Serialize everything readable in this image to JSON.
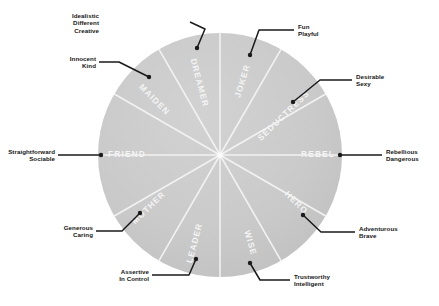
{
  "diagram": {
    "type": "pie-wheel",
    "segment_count": 12,
    "colors": {
      "segment_fill": "#c9c9c9",
      "segment_divider": "#f2f2f2",
      "segment_label": "#f4f4f4",
      "callout_line": "#1a1a1a",
      "callout_text": "#161616",
      "background": "#ffffff"
    },
    "geometry": {
      "center_x": 220,
      "center_y": 155,
      "radius": 122
    }
  },
  "segments": [
    {
      "name": "DREAMER",
      "traits": [
        "Idealistic",
        "Different",
        "Creative"
      ]
    },
    {
      "name": "JOKER",
      "traits": [
        "Fun",
        "Playful"
      ]
    },
    {
      "name": "SEDUCTRESS",
      "traits": [
        "Desirable",
        "Sexy"
      ]
    },
    {
      "name": "REBEL",
      "traits": [
        "Rebellious",
        "Dangerous"
      ]
    },
    {
      "name": "HERO",
      "traits": [
        "Adventurous",
        "Brave"
      ]
    },
    {
      "name": "WISE",
      "traits": [
        "Trustworthy",
        "Intelligent"
      ]
    },
    {
      "name": "LEADER",
      "traits": [
        "Assertive",
        "In Control"
      ]
    },
    {
      "name": "MOTHER",
      "traits": [
        "Generous",
        "Caring"
      ]
    },
    {
      "name": "FRIEND",
      "traits": [
        "Straightforward",
        "Sociable"
      ]
    },
    {
      "name": "MAIDEN",
      "traits": [
        "Innocent",
        "Kind"
      ]
    }
  ],
  "wheel_labels": {
    "dreamer": "DREAMER",
    "joker": "JOKER",
    "seductress": "SEDUCTRESS",
    "rebel": "REBEL",
    "hero": "HERO",
    "wise": "WISE",
    "leader": "LEADER",
    "mother": "MOTHER",
    "friend": "FRIEND",
    "maiden": "MAIDEN"
  },
  "callouts": {
    "dreamer": {
      "line1": "Idealistic",
      "line2": "Different",
      "line3": "Creative"
    },
    "maiden": {
      "line1": "Innocent",
      "line2": "Kind"
    },
    "friend": {
      "line1": "Straightforward",
      "line2": "Sociable"
    },
    "mother": {
      "line1": "Generous",
      "line2": "Caring"
    },
    "leader": {
      "line1": "Assertive",
      "line2": "In Control"
    },
    "wise": {
      "line1": "Trustworthy",
      "line2": "Intelligent"
    },
    "hero": {
      "line1": "Adventurous",
      "line2": "Brave"
    },
    "rebel": {
      "line1": "Rebellious",
      "line2": "Dangerous"
    },
    "seductress": {
      "line1": "Desirable",
      "line2": "Sexy"
    },
    "joker": {
      "line1": "Fun",
      "line2": "Playful"
    }
  }
}
